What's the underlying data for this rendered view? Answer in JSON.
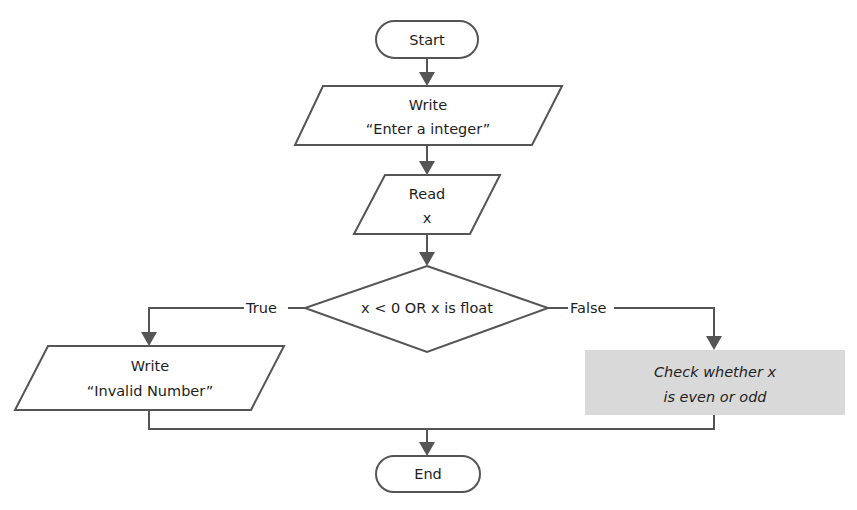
{
  "diagram": {
    "type": "flowchart",
    "nodes": {
      "start": {
        "shape": "terminator",
        "label": "Start"
      },
      "write_prompt": {
        "shape": "io",
        "line1": "Write",
        "line2": "“Enter a integer”"
      },
      "read_x": {
        "shape": "io",
        "line1": "Read",
        "line2": "x"
      },
      "decision": {
        "shape": "decision",
        "label": "x < 0 OR x is float"
      },
      "write_invalid": {
        "shape": "io",
        "line1": "Write",
        "line2": "“Invalid Number”"
      },
      "check_parity": {
        "shape": "process",
        "line1": "Check whether x",
        "line2": "is even or odd",
        "style": "italic-shaded"
      },
      "end": {
        "shape": "terminator",
        "label": "End"
      }
    },
    "edges": {
      "true_label": "True",
      "false_label": "False"
    },
    "colors": {
      "stroke": "#555555",
      "text": "#1e1e1e",
      "shaded_fill": "#d9d9d9",
      "background": "#ffffff"
    }
  }
}
